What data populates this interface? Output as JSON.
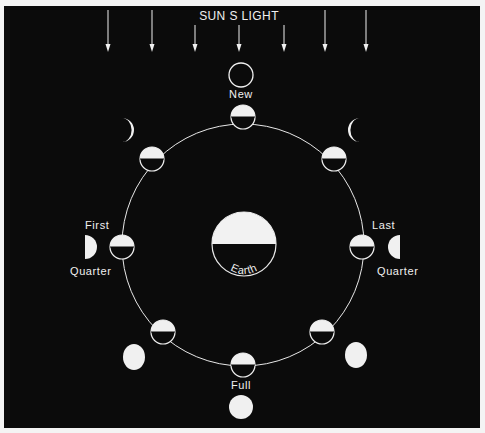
{
  "diagram": {
    "title": "SUN S LIGHT",
    "colors": {
      "background": "#0b0b0b",
      "foreground": "#f0f0f0",
      "border": "#f4f4f4"
    },
    "sunlight_arrows_x": [
      108,
      152,
      195,
      239,
      284,
      325,
      366
    ],
    "center_body": {
      "label": "Earth",
      "cx": 244,
      "cy": 244,
      "r": 32
    },
    "orbit": {
      "cx": 243,
      "cy": 245,
      "r": 121
    },
    "labels": {
      "new": "New",
      "full": "Full",
      "first": "First",
      "first_quarter": "Quarter",
      "last": "Last",
      "last_quarter": "Quarter"
    },
    "phases": [
      {
        "name": "New",
        "orbit_pos": [
          243,
          117
        ],
        "appearance": "new",
        "appearance_pos": [
          241,
          75
        ]
      },
      {
        "name": "Waxing Crescent",
        "orbit_pos": [
          152,
          159
        ],
        "appearance": "waxing-crescent",
        "appearance_pos": [
          126,
          130
        ]
      },
      {
        "name": "First Quarter",
        "orbit_pos": [
          122,
          247
        ],
        "appearance": "first-quarter",
        "appearance_pos": [
          88,
          247
        ]
      },
      {
        "name": "Waxing Gibbous",
        "orbit_pos": [
          163,
          332
        ],
        "appearance": "waxing-gibbous",
        "appearance_pos": [
          134,
          357
        ]
      },
      {
        "name": "Full",
        "orbit_pos": [
          243,
          365
        ],
        "appearance": "full",
        "appearance_pos": [
          241,
          407
        ]
      },
      {
        "name": "Waning Gibbous",
        "orbit_pos": [
          322,
          332
        ],
        "appearance": "waning-gibbous",
        "appearance_pos": [
          356,
          355
        ]
      },
      {
        "name": "Last Quarter",
        "orbit_pos": [
          362,
          247
        ],
        "appearance": "last-quarter",
        "appearance_pos": [
          397,
          247
        ]
      },
      {
        "name": "Waning Crescent",
        "orbit_pos": [
          334,
          159
        ],
        "appearance": "waning-crescent",
        "appearance_pos": [
          356,
          130
        ]
      }
    ]
  }
}
